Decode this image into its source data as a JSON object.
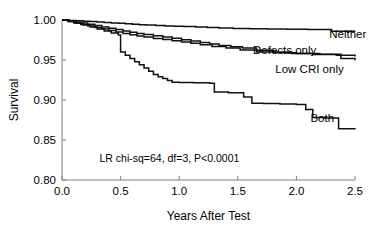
{
  "chart_data": {
    "type": "line",
    "title": "",
    "subtitle": "",
    "xlabel": "Years After Test",
    "ylabel": "Survival",
    "xlim": [
      0.0,
      2.5
    ],
    "ylim": [
      0.8,
      1.0
    ],
    "xticks": [
      "0.0",
      "0.5",
      "1.0",
      "1.5",
      "2.0",
      "2.5"
    ],
    "xtick_values": [
      0.0,
      0.5,
      1.0,
      1.5,
      2.0,
      2.5
    ],
    "yticks": [
      "0.80",
      "0.85",
      "0.90",
      "0.95",
      "1.00"
    ],
    "ytick_values": [
      0.8,
      0.85,
      0.9,
      0.95,
      1.0
    ],
    "grid": false,
    "legend_position": "inline-right-of-curves",
    "annotation": "LR chi-sq=64, df=3, P<0.0001",
    "annotation_x": 0.32,
    "annotation_y": 0.822,
    "line_color": "#111111",
    "axis_color": "#808080",
    "background_color": "#ffffff",
    "drawing": "step",
    "series": [
      {
        "name": "Neither",
        "label": "Neither",
        "label_x": 2.28,
        "label_y": 0.977,
        "x": [
          0.0,
          0.06,
          0.12,
          0.18,
          0.24,
          0.3,
          0.36,
          0.42,
          0.48,
          0.54,
          0.6,
          0.66,
          0.72,
          0.8,
          0.88,
          0.96,
          1.04,
          1.14,
          1.24,
          1.34,
          1.46,
          1.6,
          1.75,
          1.92,
          2.1,
          2.3,
          2.5
        ],
        "values": [
          1.0,
          0.9995,
          0.999,
          0.9985,
          0.998,
          0.9975,
          0.9968,
          0.9962,
          0.9958,
          0.9952,
          0.9946,
          0.994,
          0.9936,
          0.993,
          0.9926,
          0.9922,
          0.9918,
          0.9912,
          0.9906,
          0.99,
          0.9895,
          0.989,
          0.9886,
          0.9884,
          0.9882,
          0.986,
          0.9855
        ]
      },
      {
        "name": "Defects only",
        "label": "Defects only",
        "label_x": 1.63,
        "label_y": 0.957,
        "x": [
          0.0,
          0.05,
          0.1,
          0.16,
          0.22,
          0.28,
          0.34,
          0.4,
          0.46,
          0.52,
          0.58,
          0.64,
          0.7,
          0.78,
          0.86,
          0.94,
          1.02,
          1.1,
          1.18,
          1.26,
          1.34,
          1.44,
          1.54,
          1.66,
          1.8,
          1.96,
          2.14,
          2.34,
          2.5
        ],
        "values": [
          1.0,
          0.9988,
          0.9975,
          0.9962,
          0.9948,
          0.993,
          0.9912,
          0.9896,
          0.988,
          0.9862,
          0.9846,
          0.9832,
          0.9818,
          0.9802,
          0.9788,
          0.9772,
          0.9754,
          0.9736,
          0.9718,
          0.97,
          0.9682,
          0.9666,
          0.965,
          0.9622,
          0.96,
          0.9582,
          0.957,
          0.956,
          0.9545
        ]
      },
      {
        "name": "Low CRI only",
        "label": "Low CRI only",
        "label_x": 1.82,
        "label_y": 0.934,
        "x": [
          0.0,
          0.05,
          0.1,
          0.16,
          0.22,
          0.28,
          0.34,
          0.4,
          0.46,
          0.52,
          0.58,
          0.64,
          0.7,
          0.78,
          0.86,
          0.94,
          1.02,
          1.1,
          1.18,
          1.28,
          1.4,
          1.52,
          1.66,
          1.82,
          2.0,
          2.2,
          2.38,
          2.5
        ],
        "values": [
          1.0,
          0.9982,
          0.9964,
          0.9944,
          0.9926,
          0.9906,
          0.9886,
          0.9868,
          0.985,
          0.9832,
          0.9816,
          0.98,
          0.9786,
          0.977,
          0.9756,
          0.9742,
          0.9726,
          0.9708,
          0.969,
          0.967,
          0.965,
          0.9625,
          0.96,
          0.959,
          0.958,
          0.9572,
          0.952,
          0.9498
        ]
      },
      {
        "name": "Both",
        "label": "Both",
        "label_x": 2.12,
        "label_y": 0.873,
        "x": [
          0.0,
          0.06,
          0.12,
          0.18,
          0.24,
          0.3,
          0.36,
          0.42,
          0.48,
          0.5,
          0.54,
          0.58,
          0.62,
          0.66,
          0.7,
          0.74,
          0.78,
          0.82,
          0.86,
          0.9,
          0.94,
          1.0,
          1.12,
          1.26,
          1.3,
          1.42,
          1.55,
          1.62,
          1.72,
          1.86,
          2.0,
          2.08,
          2.14,
          2.24,
          2.36,
          2.5
        ],
        "values": [
          1.0,
          0.998,
          0.9958,
          0.9936,
          0.9912,
          0.9888,
          0.9862,
          0.9838,
          0.9812,
          0.96,
          0.956,
          0.952,
          0.9478,
          0.944,
          0.94,
          0.936,
          0.932,
          0.9292,
          0.9268,
          0.9244,
          0.9222,
          0.922,
          0.9215,
          0.921,
          0.91,
          0.909,
          0.9038,
          0.896,
          0.8955,
          0.895,
          0.8945,
          0.888,
          0.878,
          0.8775,
          0.864,
          0.8635
        ]
      }
    ]
  },
  "axis_titles": {
    "x": "Years After Test",
    "y": "Survival"
  }
}
